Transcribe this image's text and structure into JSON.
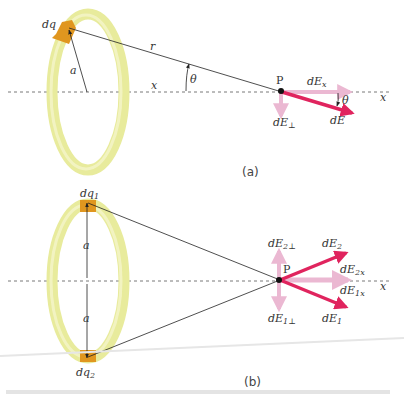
{
  "figure": {
    "panel_a": {
      "caption": "(a)",
      "charge_label": "dq",
      "radius_label": "a",
      "distance_label": "r",
      "axis_distance_label": "x",
      "angle_label": "θ",
      "point_label": "P",
      "axis_label": "x",
      "dEx_label_main": "dE",
      "dEx_label_sub": "x",
      "dEperp_label_main": "dE",
      "dEperp_label_sub": "⊥",
      "dE_label": "dE",
      "dE_angle_label": "θ"
    },
    "panel_b": {
      "caption": "(b)",
      "charge1_label_main": "dq",
      "charge1_label_sub": "1",
      "charge2_label_main": "dq",
      "charge2_label_sub": "2",
      "radius_top_label": "a",
      "radius_bottom_label": "a",
      "point_label": "P",
      "axis_label": "x",
      "dE2perp_main": "dE",
      "dE2perp_sub": "2⊥",
      "dE1perp_main": "dE",
      "dE1perp_sub": "1⊥",
      "dE2_main": "dE",
      "dE2_sub": "2",
      "dE1_main": "dE",
      "dE1_sub": "1",
      "dE2x_main": "dE",
      "dE2x_sub": "2x",
      "dE1x_main": "dE",
      "dE1x_sub": "1x"
    },
    "colors": {
      "ring": "#e8eb9c",
      "ring_highlight": "#f6f7d2",
      "charge": "#e0961f",
      "vector": "#e0245e",
      "component": "#ebb8d2",
      "line": "#222222",
      "axis": "#555555"
    }
  }
}
